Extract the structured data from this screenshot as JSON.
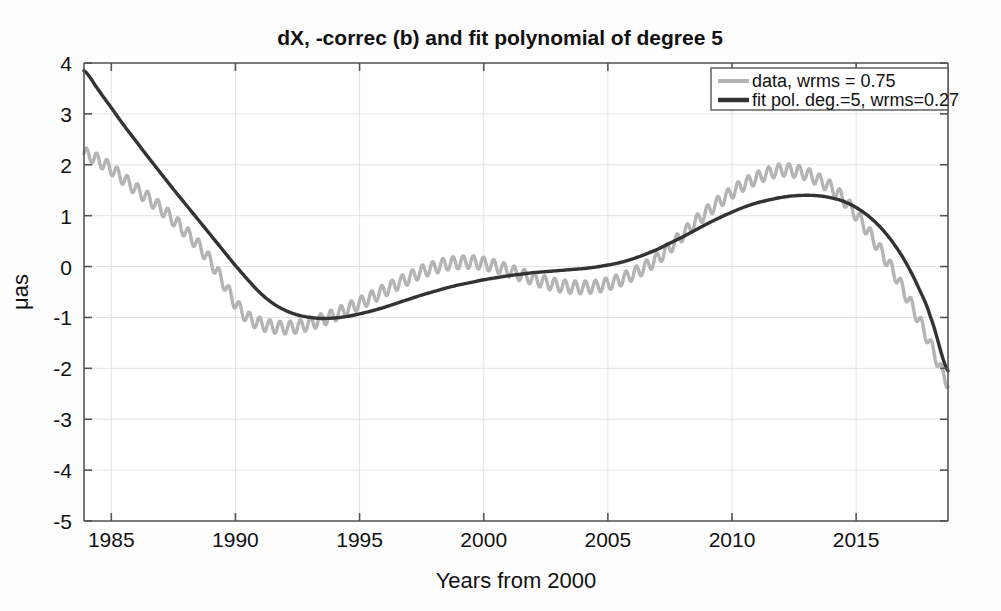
{
  "chart_data": {
    "type": "line",
    "title": "dX, -correc (b) and fit polynomial of degree 5",
    "xlabel": "Years from 2000",
    "ylabel": "μas",
    "xlim": [
      1983.9,
      2018.7
    ],
    "ylim": [
      -5,
      4
    ],
    "xticks": [
      1985,
      1990,
      1995,
      2000,
      2005,
      2010,
      2015
    ],
    "xtick_labels": [
      "1985",
      "1990",
      "1995",
      "2000",
      "2005",
      "2010",
      "2015"
    ],
    "yticks": [
      4,
      3,
      2,
      1,
      0,
      -1,
      -2,
      -3,
      -4,
      -5
    ],
    "ytick_labels": [
      "4",
      "3",
      "2",
      "1",
      "0",
      "-1",
      "-2",
      "-3",
      "-4",
      "-5"
    ],
    "grid": true,
    "legend_position": "top-right",
    "colors": {
      "data": "#b4b4b4",
      "fit": "#333333",
      "grid": "#e3e3e3",
      "axis": "#555555",
      "background": "#fdfdfd"
    },
    "series": [
      {
        "name": "data, wrms = 0.75",
        "color": "#b4b4b4",
        "linewidth": 3.4,
        "oscillation": {
          "amplitude": 0.125,
          "period_years": 0.41,
          "phase": 0.0
        },
        "x": [
          1983.9,
          1984.5,
          1985.0,
          1985.5,
          1986.0,
          1986.5,
          1987.0,
          1987.5,
          1988.0,
          1988.5,
          1989.0,
          1989.5,
          1990.0,
          1990.5,
          1991.0,
          1991.5,
          1992.0,
          1992.5,
          1993.0,
          1993.5,
          1994.0,
          1994.5,
          1995.0,
          1995.5,
          1996.0,
          1996.5,
          1997.0,
          1997.5,
          1998.0,
          1998.5,
          1999.0,
          1999.5,
          2000.0,
          2000.5,
          2001.0,
          2001.5,
          2002.0,
          2002.5,
          2003.0,
          2003.5,
          2004.0,
          2004.5,
          2005.0,
          2005.5,
          2006.0,
          2006.5,
          2007.0,
          2007.5,
          2008.0,
          2008.5,
          2009.0,
          2009.5,
          2010.0,
          2010.5,
          2011.0,
          2011.5,
          2012.0,
          2012.5,
          2013.0,
          2013.5,
          2014.0,
          2014.5,
          2015.0,
          2015.5,
          2016.0,
          2016.5,
          2017.0,
          2017.5,
          2018.0,
          2018.7
        ],
        "y": [
          2.22,
          2.08,
          1.92,
          1.72,
          1.52,
          1.34,
          1.14,
          0.92,
          0.68,
          0.42,
          0.1,
          -0.3,
          -0.72,
          -1.0,
          -1.12,
          -1.18,
          -1.2,
          -1.18,
          -1.12,
          -1.04,
          -0.95,
          -0.84,
          -0.72,
          -0.6,
          -0.47,
          -0.34,
          -0.22,
          -0.1,
          -0.02,
          0.05,
          0.08,
          0.09,
          0.06,
          0.0,
          -0.08,
          -0.16,
          -0.24,
          -0.31,
          -0.37,
          -0.4,
          -0.41,
          -0.39,
          -0.34,
          -0.26,
          -0.15,
          -0.01,
          0.16,
          0.38,
          0.62,
          0.86,
          1.08,
          1.28,
          1.46,
          1.62,
          1.74,
          1.84,
          1.9,
          1.88,
          1.82,
          1.7,
          1.55,
          1.32,
          1.02,
          0.68,
          0.3,
          -0.1,
          -0.55,
          -1.02,
          -1.55,
          -2.28
        ]
      },
      {
        "name": "fit pol. deg.=5, wrms=0.27",
        "color": "#333333",
        "linewidth": 3.4,
        "oscillation": null,
        "x": [
          1983.9,
          1984.5,
          1985.0,
          1985.5,
          1986.0,
          1986.5,
          1987.0,
          1987.5,
          1988.0,
          1988.5,
          1989.0,
          1989.5,
          1990.0,
          1990.5,
          1991.0,
          1991.5,
          1992.0,
          1992.5,
          1993.0,
          1993.5,
          1994.0,
          1994.5,
          1995.0,
          1995.5,
          1996.0,
          1996.5,
          1997.0,
          1997.5,
          1998.0,
          1998.5,
          1999.0,
          1999.5,
          2000.0,
          2000.5,
          2001.0,
          2001.5,
          2002.0,
          2002.5,
          2003.0,
          2003.5,
          2004.0,
          2004.5,
          2005.0,
          2005.5,
          2006.0,
          2006.5,
          2007.0,
          2007.5,
          2008.0,
          2008.5,
          2009.0,
          2009.5,
          2010.0,
          2010.5,
          2011.0,
          2011.5,
          2012.0,
          2012.5,
          2013.0,
          2013.5,
          2014.0,
          2014.5,
          2015.0,
          2015.5,
          2016.0,
          2016.5,
          2017.0,
          2017.5,
          2018.0,
          2018.7
        ],
        "y": [
          3.85,
          3.46,
          3.12,
          2.78,
          2.46,
          2.14,
          1.83,
          1.52,
          1.22,
          0.92,
          0.62,
          0.32,
          0.02,
          -0.26,
          -0.52,
          -0.72,
          -0.86,
          -0.95,
          -1.0,
          -1.02,
          -1.01,
          -0.98,
          -0.93,
          -0.87,
          -0.8,
          -0.72,
          -0.64,
          -0.56,
          -0.49,
          -0.42,
          -0.36,
          -0.31,
          -0.26,
          -0.22,
          -0.18,
          -0.15,
          -0.12,
          -0.1,
          -0.08,
          -0.06,
          -0.04,
          -0.01,
          0.03,
          0.08,
          0.15,
          0.24,
          0.34,
          0.46,
          0.58,
          0.71,
          0.84,
          0.96,
          1.07,
          1.17,
          1.25,
          1.31,
          1.36,
          1.39,
          1.4,
          1.39,
          1.35,
          1.28,
          1.16,
          0.99,
          0.76,
          0.46,
          0.08,
          -0.4,
          -1.0,
          -2.05
        ]
      }
    ],
    "legend": [
      {
        "label": "data, wrms = 0.75",
        "color": "#b4b4b4"
      },
      {
        "label": "fit pol. deg.=5, wrms=0.27",
        "color": "#333333"
      }
    ]
  }
}
